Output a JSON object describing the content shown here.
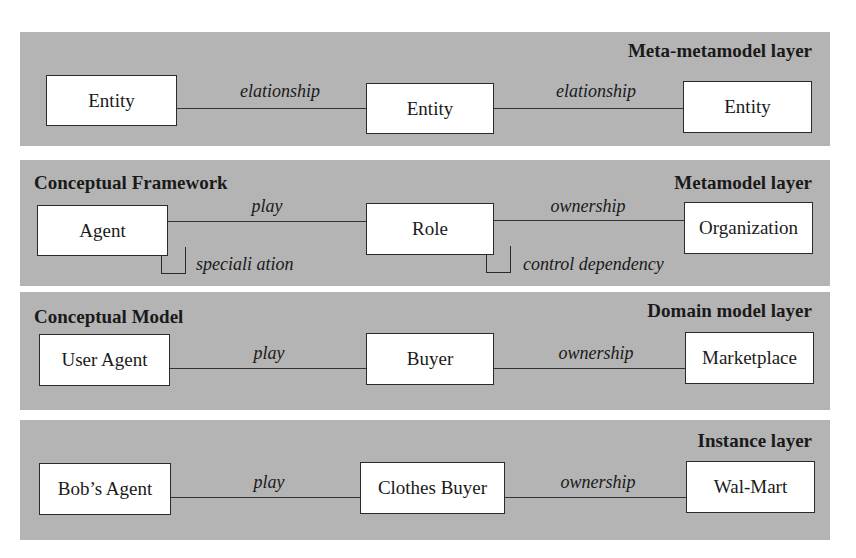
{
  "figure": {
    "layers": [
      {
        "title": "Meta-metamodel layer",
        "subtitle": "",
        "entities": [
          "Entity",
          "Entity",
          "Entity"
        ],
        "relations": [
          "elationship",
          "elationship"
        ],
        "self_relations": []
      },
      {
        "title": "Metamodel layer",
        "subtitle": "Conceptual Framework",
        "entities": [
          "Agent",
          "Role",
          "Organization"
        ],
        "relations": [
          "play",
          "ownership"
        ],
        "self_relations": [
          "speciali ation",
          "control dependency"
        ]
      },
      {
        "title": "Domain model layer",
        "subtitle": "Conceptual Model",
        "entities": [
          "User Agent",
          "Buyer",
          "Marketplace"
        ],
        "relations": [
          "play",
          "ownership"
        ],
        "self_relations": []
      },
      {
        "title": "Instance layer",
        "subtitle": "",
        "entities": [
          "Bob’s Agent",
          "Clothes Buyer",
          "Wal-Mart"
        ],
        "relations": [
          "play",
          "ownership"
        ],
        "self_relations": []
      }
    ],
    "colors": {
      "layer_background": "#b4b4b4",
      "box_fill": "#ffffff",
      "stroke": "#2a2a2a"
    }
  }
}
